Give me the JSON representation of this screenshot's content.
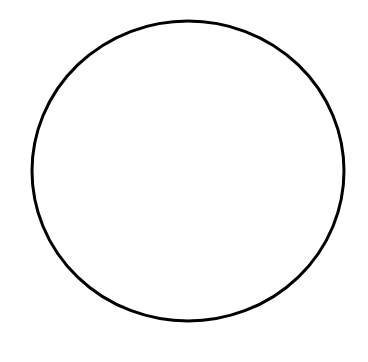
{
  "shape": {
    "type": "ellipse",
    "cx": 188,
    "cy": 171,
    "rx": 156,
    "ry": 150,
    "stroke": "#000000",
    "stroke_width": 3,
    "fill": "#ffffff"
  },
  "background": "#ffffff"
}
